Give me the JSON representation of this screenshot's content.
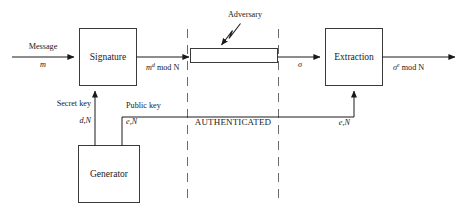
{
  "diagram": {
    "boxes": {
      "signature": "Signature",
      "extraction": "Extraction",
      "generator": "Generator",
      "channel": ""
    },
    "labels": {
      "message": "Message",
      "message_var": "m",
      "signed_base": "m",
      "signed_sup": "d",
      "signed_mod": " mod N",
      "sigma": "σ",
      "verified_base": "σ",
      "verified_sup": "e",
      "verified_mod": " mod N",
      "adversary": "Adversary",
      "secret_key": "Secret key",
      "secret_key_var": "d,N",
      "public_key": "Public key",
      "public_key_var": "e,N",
      "public_key_var_right": "e,N",
      "authenticated": "AUTHENTICATED"
    },
    "colors": {
      "ink": "#1a1a1a",
      "box_stroke": "#3a3a3a",
      "dashed_stroke": "#6a6a6a",
      "background": "#ffffff"
    }
  }
}
